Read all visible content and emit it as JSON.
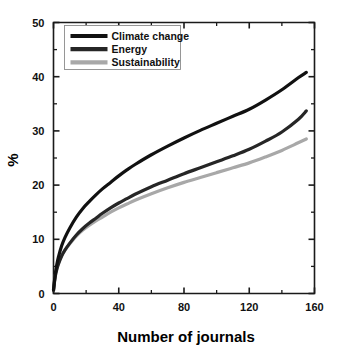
{
  "chart_data": {
    "type": "line",
    "title": "",
    "xlabel": "Number of journals",
    "ylabel": "%",
    "xlim": [
      0,
      160
    ],
    "ylim": [
      0,
      50
    ],
    "xticks": [
      0,
      40,
      80,
      120,
      160
    ],
    "yticks": [
      0,
      10,
      20,
      30,
      40,
      50
    ],
    "xticks_minor": [
      20,
      60,
      100,
      140
    ],
    "yticks_minor": [
      5,
      15,
      25,
      35,
      45
    ],
    "grid": false,
    "legend_position": "top-left inside axes",
    "x": [
      0,
      1,
      2,
      3,
      5,
      7,
      10,
      14,
      18,
      22,
      26,
      30,
      35,
      40,
      45,
      50,
      60,
      70,
      80,
      90,
      100,
      110,
      120,
      130,
      140,
      150,
      155
    ],
    "series": [
      {
        "name": "Climate change",
        "color": "#111111",
        "values": [
          0.6,
          3.4,
          5.3,
          6.7,
          8.8,
          10.3,
          12.1,
          14.1,
          15.7,
          17.0,
          18.2,
          19.3,
          20.5,
          21.7,
          22.8,
          23.8,
          25.6,
          27.2,
          28.7,
          30.1,
          31.4,
          32.7,
          34.0,
          35.7,
          37.6,
          39.8,
          40.8
        ]
      },
      {
        "name": "Energy",
        "color": "#262626",
        "values": [
          0.6,
          3.0,
          4.4,
          5.4,
          6.9,
          8.0,
          9.3,
          10.8,
          12.0,
          13.0,
          13.9,
          14.8,
          15.8,
          16.7,
          17.5,
          18.3,
          19.7,
          20.9,
          22.1,
          23.2,
          24.3,
          25.4,
          26.6,
          28.1,
          29.8,
          32.1,
          33.7
        ]
      },
      {
        "name": "Sustainability",
        "color": "#a8a8a8",
        "values": [
          0.6,
          3.2,
          4.6,
          5.6,
          7.0,
          8.0,
          9.2,
          10.6,
          11.7,
          12.6,
          13.4,
          14.1,
          15.0,
          15.8,
          16.5,
          17.2,
          18.4,
          19.5,
          20.5,
          21.4,
          22.3,
          23.2,
          24.1,
          25.2,
          26.4,
          27.8,
          28.5
        ]
      }
    ]
  },
  "legend": {
    "items": [
      {
        "label": "Climate change"
      },
      {
        "label": "Energy"
      },
      {
        "label": "Sustainability"
      }
    ]
  },
  "axes": {
    "x_title": "Number of journals",
    "y_title": "%"
  }
}
